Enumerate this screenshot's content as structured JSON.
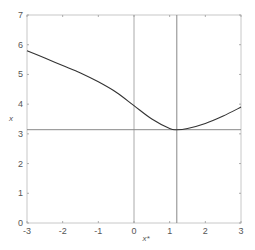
{
  "chart_data": {
    "type": "line",
    "title": "",
    "xlabel": "x*",
    "ylabel": "x",
    "xlim": [
      -3,
      3
    ],
    "ylim": [
      0,
      7
    ],
    "xticks": [
      -3,
      -2,
      -1,
      0,
      1,
      2,
      3
    ],
    "yticks": [
      0,
      1,
      2,
      3,
      4,
      5,
      6,
      7
    ],
    "xtick_labels": [
      "-3",
      "-2",
      "-1",
      "0",
      "1",
      "2",
      "3"
    ],
    "ytick_labels": [
      "0",
      "1",
      "2",
      "3",
      "4",
      "5",
      "6",
      "7"
    ],
    "grid": false,
    "series": [
      {
        "name": "curve",
        "color": "#333333",
        "x": [
          -3,
          -2.5,
          -2,
          -1.5,
          -1,
          -0.5,
          0,
          0.5,
          1,
          1.2,
          1.5,
          2,
          2.5,
          3
        ],
        "y": [
          5.8,
          5.55,
          5.3,
          5.05,
          4.75,
          4.4,
          3.95,
          3.5,
          3.18,
          3.14,
          3.18,
          3.35,
          3.6,
          3.9
        ]
      }
    ],
    "reference_lines": [
      {
        "orientation": "vertical",
        "value": 0,
        "color": "#aaaaaa"
      },
      {
        "orientation": "vertical",
        "value": 1.2,
        "color": "#888888"
      },
      {
        "orientation": "horizontal",
        "value": 3.14,
        "color": "#888888"
      }
    ]
  }
}
